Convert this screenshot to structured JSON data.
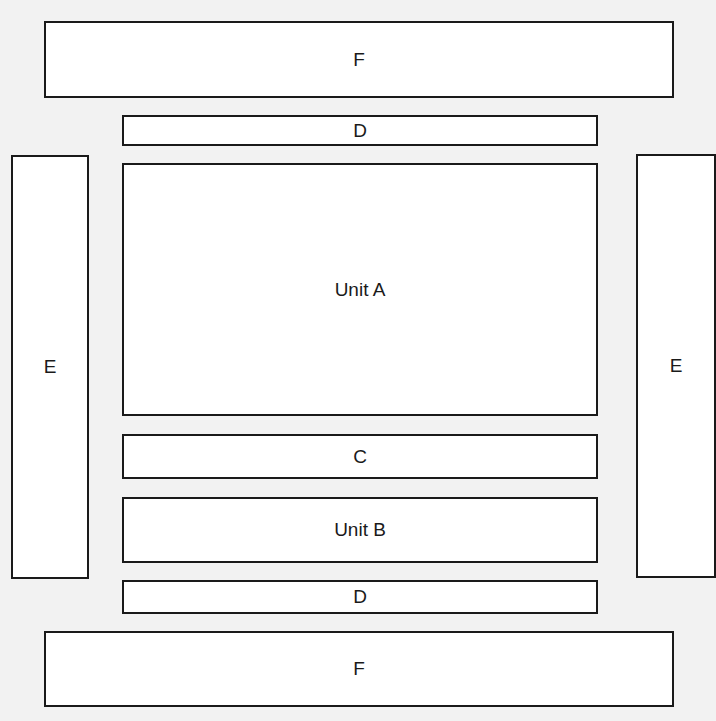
{
  "diagram": {
    "background": "#f2f2f2",
    "stroke": "#1a1a1a",
    "fill": "#ffffff",
    "boxes": {
      "f_top": {
        "label": "F",
        "x": 44,
        "y": 21,
        "w": 630,
        "h": 77
      },
      "d_top": {
        "label": "D",
        "x": 122,
        "y": 115,
        "w": 476,
        "h": 31
      },
      "e_left": {
        "label": "E",
        "x": 11,
        "y": 155,
        "w": 78,
        "h": 424
      },
      "unit_a": {
        "label": "Unit A",
        "x": 122,
        "y": 163,
        "w": 476,
        "h": 253
      },
      "e_right": {
        "label": "E",
        "x": 636,
        "y": 154,
        "w": 80,
        "h": 424
      },
      "c": {
        "label": "C",
        "x": 122,
        "y": 434,
        "w": 476,
        "h": 45
      },
      "unit_b": {
        "label": "Unit B",
        "x": 122,
        "y": 497,
        "w": 476,
        "h": 66
      },
      "d_bottom": {
        "label": "D",
        "x": 122,
        "y": 580,
        "w": 476,
        "h": 34
      },
      "f_bottom": {
        "label": "F",
        "x": 44,
        "y": 631,
        "w": 630,
        "h": 76
      }
    }
  }
}
